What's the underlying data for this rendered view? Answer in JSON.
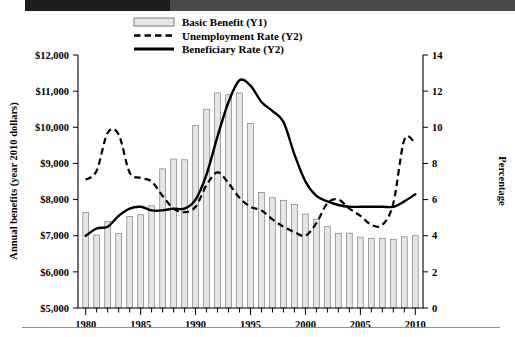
{
  "chart_data": {
    "type": "bar",
    "title": "",
    "xlabel": "",
    "ylabel": "Annual benefits (year 2010 dollars)",
    "y2label": "Percentage",
    "xlim": [
      1979.3,
      2010.7
    ],
    "ylim": [
      5000,
      12000
    ],
    "y2lim": [
      0,
      14
    ],
    "grid": false,
    "legend_position": "top-center",
    "x_tick_labels": [
      "1980",
      "1985",
      "1990",
      "1995",
      "2000",
      "2005",
      "2010"
    ],
    "x_tick_values": [
      1980,
      1985,
      1990,
      1995,
      2000,
      2005,
      2010
    ],
    "x_minor_ticks_every": 1,
    "y_tick_labels": [
      "$5,000",
      "$6,000",
      "$7,000",
      "$8,000",
      "$9,000",
      "$10,000",
      "$11,000",
      "$12,000"
    ],
    "y_tick_values": [
      5000,
      6000,
      7000,
      8000,
      9000,
      10000,
      11000,
      12000
    ],
    "y2_tick_labels": [
      "0",
      "2",
      "4",
      "6",
      "8",
      "10",
      "12",
      "14"
    ],
    "y2_tick_values": [
      0,
      2,
      4,
      6,
      8,
      10,
      12,
      14
    ],
    "categories": [
      1980,
      1981,
      1982,
      1983,
      1984,
      1985,
      1986,
      1987,
      1988,
      1989,
      1990,
      1991,
      1992,
      1993,
      1994,
      1995,
      1996,
      1997,
      1998,
      1999,
      2000,
      2001,
      2002,
      2003,
      2004,
      2005,
      2006,
      2007,
      2008,
      2009,
      2010
    ],
    "series": [
      {
        "name": "Basic Benefit (Y1)",
        "axis": "y1",
        "style": "bar",
        "color": "#e6e6e6",
        "edge_color": "#7d7d7d",
        "values": [
          7650,
          7020,
          7400,
          7060,
          7530,
          7580,
          7830,
          8850,
          9120,
          9100,
          10050,
          10500,
          10950,
          10900,
          10950,
          10100,
          8200,
          8050,
          7980,
          7870,
          7600,
          7450,
          7250,
          7060,
          7070,
          6960,
          6920,
          6930,
          6900,
          6970,
          7000
        ]
      },
      {
        "name": "Unemployment Rate (Y2)",
        "axis": "y2",
        "style": "dashed-line",
        "color": "#000000",
        "values": [
          7.1,
          7.6,
          9.7,
          9.6,
          7.5,
          7.2,
          7.0,
          6.2,
          5.5,
          5.3,
          5.6,
          6.8,
          7.5,
          6.9,
          6.1,
          5.6,
          5.4,
          4.9,
          4.5,
          4.2,
          4.0,
          4.7,
          5.8,
          6.0,
          5.5,
          5.1,
          4.6,
          4.6,
          5.8,
          9.3,
          9.1
        ]
      },
      {
        "name": "Beneficiary Rate (Y2)",
        "axis": "y2",
        "style": "solid-line",
        "color": "#000000",
        "values": [
          4.0,
          4.4,
          4.5,
          5.1,
          5.5,
          5.6,
          5.4,
          5.4,
          5.5,
          5.5,
          6.0,
          7.4,
          9.5,
          11.4,
          12.6,
          12.3,
          11.4,
          10.9,
          10.3,
          8.5,
          7.0,
          6.2,
          5.9,
          5.7,
          5.6,
          5.6,
          5.6,
          5.6,
          5.6,
          5.9,
          6.3
        ]
      }
    ],
    "legend": [
      {
        "label": "Basic Benefit (Y1)",
        "marker": "bar-swatch"
      },
      {
        "label": "Unemployment Rate (Y2)",
        "marker": "dashed-line"
      },
      {
        "label": "Beneficiary Rate (Y2)",
        "marker": "solid-line"
      }
    ]
  }
}
